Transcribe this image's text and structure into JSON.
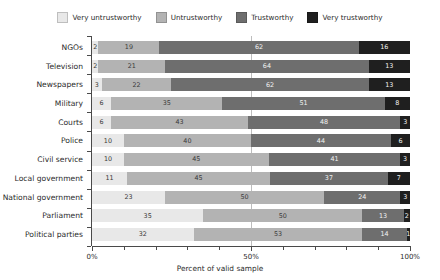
{
  "chart_data": {
    "type": "bar",
    "subtype": "stacked-horizontal-100pct",
    "title": "",
    "xlabel": "Percent of valid sample",
    "ylabel": "",
    "xlim": [
      0,
      100
    ],
    "xticks": [
      0,
      10,
      20,
      30,
      40,
      50,
      60,
      70,
      80,
      90,
      100
    ],
    "xticklabels": [
      "0%",
      "",
      "",
      "",
      "",
      "50%",
      "",
      "",
      "",
      "",
      "100%"
    ],
    "grid": false,
    "midline_at": 50,
    "legend_position": "top-center",
    "categories": [
      "NGOs",
      "Television",
      "Newspapers",
      "Military",
      "Courts",
      "Police",
      "Civil service",
      "Local government",
      "National government",
      "Parliament",
      "Political parties"
    ],
    "series": [
      {
        "name": "Very untrustworthy",
        "color": "#e8e8e8",
        "values": [
          2,
          2,
          3,
          6,
          6,
          10,
          10,
          11,
          23,
          35,
          32
        ]
      },
      {
        "name": "Untrustworthy",
        "color": "#b3b3b3",
        "values": [
          19,
          21,
          22,
          35,
          43,
          40,
          45,
          45,
          50,
          50,
          53
        ]
      },
      {
        "name": "Trustworthy",
        "color": "#6e6e6e",
        "values": [
          62,
          64,
          62,
          51,
          48,
          44,
          41,
          37,
          24,
          13,
          14
        ]
      },
      {
        "name": "Very trustworthy",
        "color": "#1f1f1f",
        "values": [
          16,
          13,
          13,
          8,
          3,
          6,
          3,
          7,
          3,
          2,
          1
        ]
      }
    ]
  },
  "legend": {
    "entries": [
      {
        "label": "Very untrustworthy",
        "color": "#e8e8e8"
      },
      {
        "label": "Untrustworthy",
        "color": "#b3b3b3"
      },
      {
        "label": "Trustworthy",
        "color": "#6e6e6e"
      },
      {
        "label": "Very trustworthy",
        "color": "#1f1f1f"
      }
    ]
  },
  "axis": {
    "x_title": "Percent of valid sample",
    "x_tick_labels": [
      "0%",
      "50%",
      "100%"
    ]
  }
}
